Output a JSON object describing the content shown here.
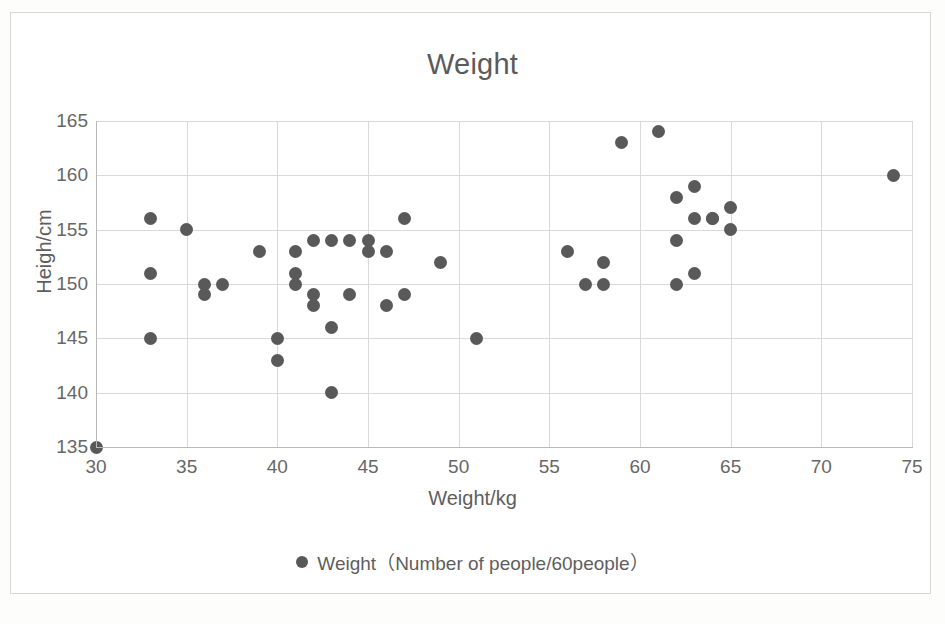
{
  "chart_data": {
    "type": "scatter",
    "title": "Weight",
    "xlabel": "Weight/kg",
    "ylabel": "Heigh/cm",
    "xlim": [
      30,
      75
    ],
    "ylim": [
      135,
      165
    ],
    "xticks": [
      30,
      35,
      40,
      45,
      50,
      55,
      60,
      65,
      70,
      75
    ],
    "yticks": [
      135,
      140,
      145,
      150,
      155,
      160,
      165
    ],
    "grid": true,
    "legend_position": "bottom",
    "marker_color": "#595959",
    "gridline_color": "#d9d9d9",
    "series": [
      {
        "name": "Weight（Number of people/60people）",
        "points": [
          [
            30,
            135
          ],
          [
            33,
            156
          ],
          [
            33,
            151
          ],
          [
            33,
            145
          ],
          [
            35,
            155
          ],
          [
            36,
            150
          ],
          [
            36,
            149
          ],
          [
            37,
            150
          ],
          [
            39,
            153
          ],
          [
            40,
            143
          ],
          [
            40,
            145
          ],
          [
            41,
            151
          ],
          [
            41,
            150
          ],
          [
            41,
            153
          ],
          [
            42,
            149
          ],
          [
            42,
            148
          ],
          [
            42,
            154
          ],
          [
            43,
            146
          ],
          [
            43,
            140
          ],
          [
            43,
            154
          ],
          [
            44,
            149
          ],
          [
            44,
            154
          ],
          [
            45,
            154
          ],
          [
            45,
            153
          ],
          [
            46,
            148
          ],
          [
            46,
            153
          ],
          [
            47,
            156
          ],
          [
            47,
            149
          ],
          [
            49,
            152
          ],
          [
            51,
            145
          ],
          [
            56,
            153
          ],
          [
            57,
            150
          ],
          [
            58,
            152
          ],
          [
            58,
            150
          ],
          [
            59,
            163
          ],
          [
            61,
            164
          ],
          [
            62,
            158
          ],
          [
            62,
            154
          ],
          [
            62,
            150
          ],
          [
            63,
            159
          ],
          [
            63,
            156
          ],
          [
            63,
            151
          ],
          [
            64,
            156
          ],
          [
            64,
            156
          ],
          [
            65,
            157
          ],
          [
            65,
            155
          ],
          [
            74,
            160
          ]
        ]
      }
    ]
  },
  "legend": {
    "marker": "filled-circle",
    "label": "Weight（Number of people/60people）"
  }
}
